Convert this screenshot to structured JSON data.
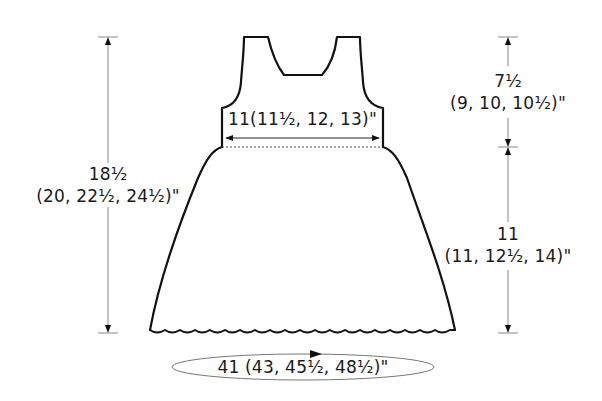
{
  "diagram": {
    "type": "knitting-schematic",
    "colors": {
      "outline": "#111111",
      "dimension_line": "#8a8a8a",
      "arrowhead": "#111111",
      "text": "#1a1a1a",
      "background": "#ffffff"
    },
    "measurements": {
      "total_length": {
        "line1": "18½",
        "line2": "(20, 22½, 24½)\""
      },
      "bodice_length": {
        "line1": "7½",
        "line2": "(9, 10, 10½)\""
      },
      "skirt_length": {
        "line1": "11",
        "line2": "(11, 12½, 14)\""
      },
      "bodice_width": {
        "text": "11(11½, 12, 13)\""
      },
      "hem_circumference": {
        "text": "41 (43, 45½, 48½)\""
      }
    }
  }
}
